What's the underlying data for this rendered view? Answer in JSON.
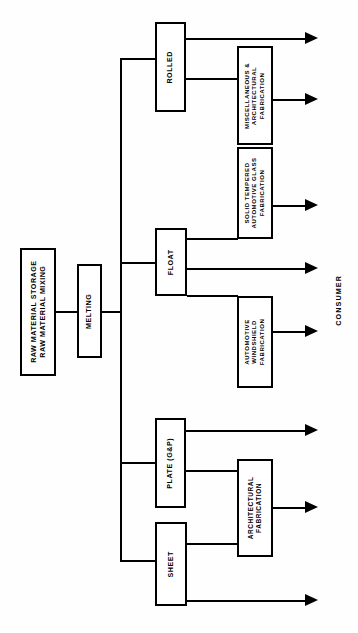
{
  "diagram": {
    "orientation": "rotated-90-ccw",
    "line_color": "#000000",
    "background_color": "#ffffff",
    "nodes": {
      "raw_material": {
        "line1": "RAW  MATERIAL  STORAGE",
        "line2": "RAW  MATERIAL  MIXING"
      },
      "melting": {
        "label": "MELTING"
      },
      "rolled": {
        "label": "ROLLED"
      },
      "float": {
        "label": "FLOAT"
      },
      "plate": {
        "label": "PLATE (G&P)"
      },
      "sheet": {
        "label": "SHEET"
      },
      "misc_arch_fab": {
        "line1": "MISCELLANEOUS &",
        "line2": "ARCHITECTURAL",
        "line3": "FABRICATION"
      },
      "solid_tempered_fab": {
        "line1": "SOLID  TEMPERED",
        "line2": "AUTOMOTIVE GLASS",
        "line3": "FABRICATION"
      },
      "auto_windshield_fab": {
        "line1": "AUTOMOTIVE",
        "line2": "WINDSHIELD",
        "line3": "FABRICATION"
      },
      "architectural_fab": {
        "line1": "ARCHITECTURAL",
        "line2": "FABRICATION"
      }
    },
    "endpoint_label": "CONSUMER",
    "flow": {
      "stages": [
        "Raw Material",
        "Melting",
        "Forming",
        "Fabrication",
        "Consumer"
      ],
      "forming_branches": [
        "ROLLED",
        "FLOAT",
        "PLATE (G&P)",
        "SHEET"
      ],
      "outputs_count": 7
    }
  }
}
